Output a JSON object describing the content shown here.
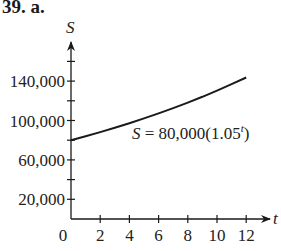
{
  "problem_label": "39. a.",
  "chart_data": {
    "type": "line",
    "title": "",
    "xlabel": "t",
    "ylabel": "S",
    "equation_label": "S = 80,000(1.05^t)",
    "equation_parts": {
      "lhs": "S = 80,000(1.05",
      "exp": "t",
      "close": ")"
    },
    "x_ticks": [
      2,
      4,
      6,
      8,
      10,
      12
    ],
    "x_tick_labels": [
      "0",
      "2",
      "4",
      "6",
      "8",
      "10",
      "12"
    ],
    "y_tick_labels": [
      "20,000",
      "60,000",
      "100,000",
      "140,000"
    ],
    "y_ticks_minor": [
      40000,
      80000,
      120000,
      160000
    ],
    "xlim": [
      0,
      12
    ],
    "ylim": [
      0,
      165000
    ],
    "grid": false,
    "series": [
      {
        "name": "S = 80,000(1.05^t)",
        "x": [
          0,
          1,
          2,
          3,
          4,
          5,
          6,
          7,
          8,
          9,
          10,
          11,
          12
        ],
        "y": [
          80000,
          84000,
          88200,
          92610,
          97241,
          102103,
          107208,
          112568,
          118196,
          124106,
          130312,
          136827,
          143668
        ]
      }
    ]
  }
}
